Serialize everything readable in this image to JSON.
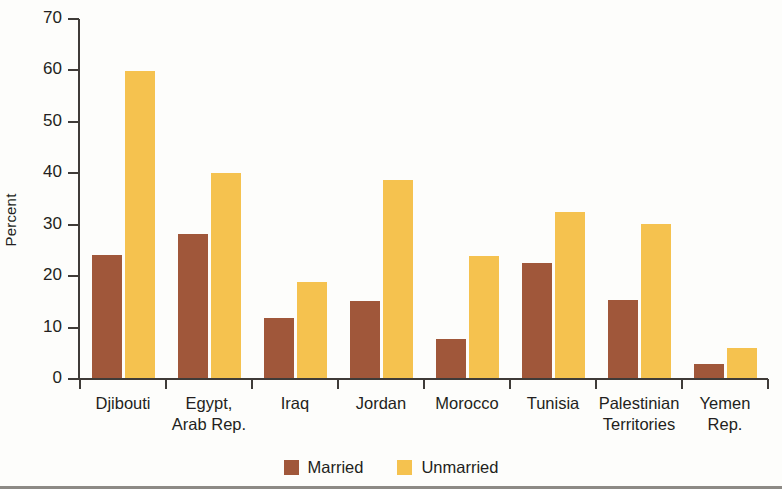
{
  "chart_data": {
    "type": "bar",
    "title": "",
    "subtitle": "",
    "xlabel": "",
    "ylabel": "Percent",
    "ylim": [
      0,
      70
    ],
    "yticks": [
      0,
      10,
      20,
      30,
      40,
      50,
      60,
      70
    ],
    "ytick_labels": [
      "0",
      "10",
      "20",
      "30",
      "40",
      "50",
      "60",
      "70"
    ],
    "grid": false,
    "legend_position": "bottom-center",
    "categories": [
      "Djibouti",
      "Egypt, Arab Rep.",
      "Iraq",
      "Jordan",
      "Morocco",
      "Tunisia",
      "Palestinian Territories",
      "Yemen Rep."
    ],
    "series": [
      {
        "name": "Married",
        "color": "#a0573a",
        "values": [
          24.3,
          28.3,
          12.0,
          15.3,
          7.9,
          22.7,
          15.6,
          3.2
        ]
      },
      {
        "name": "Unmarried",
        "color": "#f5c24f",
        "values": [
          60.0,
          40.2,
          19.1,
          38.9,
          24.1,
          32.7,
          30.3,
          6.2
        ]
      }
    ]
  },
  "axis": {
    "y_label": "Percent"
  },
  "legend": {
    "items": [
      {
        "label": "Married",
        "color": "#a0573a"
      },
      {
        "label": "Unmarried",
        "color": "#f5c24f"
      }
    ]
  }
}
